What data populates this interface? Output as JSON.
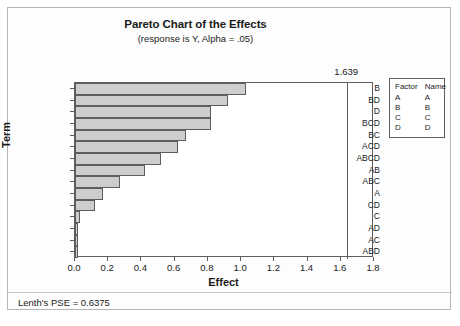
{
  "chart_data": {
    "type": "bar",
    "orientation": "horizontal",
    "title": "Pareto Chart of the Effects",
    "subtitle": "(response is Y, Alpha = .05)",
    "xlabel": "Effect",
    "ylabel": "Term",
    "xlim": [
      0.0,
      1.8
    ],
    "xticks": [
      "0.0",
      "0.2",
      "0.4",
      "0.6",
      "0.8",
      "1.0",
      "1.2",
      "1.4",
      "1.6",
      "1.8"
    ],
    "xtick_values": [
      0.0,
      0.2,
      0.4,
      0.6,
      0.8,
      1.0,
      1.2,
      1.4,
      1.6,
      1.8
    ],
    "grid": false,
    "categories": [
      "B",
      "BD",
      "D",
      "BCD",
      "BC",
      "ACD",
      "ABCD",
      "AB",
      "ABC",
      "A",
      "CD",
      "C",
      "AD",
      "AC",
      "ABD"
    ],
    "values": [
      1.03,
      0.92,
      0.82,
      0.82,
      0.67,
      0.62,
      0.52,
      0.42,
      0.27,
      0.17,
      0.12,
      0.03,
      0.02,
      0.02,
      0.02
    ],
    "reference_line": {
      "value": 1.639,
      "label": "1.639"
    },
    "bar_color": "#cdcdcd",
    "bar_edge_color": "#5d5d5d",
    "annotation": "Lenth's PSE = 0.6375"
  },
  "legend": {
    "headers": [
      "Factor",
      "Name"
    ],
    "rows": [
      {
        "factor": "A",
        "name": "A"
      },
      {
        "factor": "B",
        "name": "B"
      },
      {
        "factor": "C",
        "name": "C"
      },
      {
        "factor": "D",
        "name": "D"
      }
    ]
  }
}
